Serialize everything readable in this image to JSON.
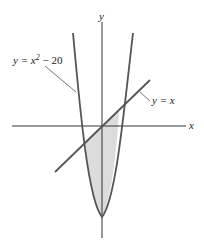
{
  "figure": {
    "axes": {
      "x_label": "x",
      "y_label": "y"
    },
    "curves": [
      {
        "id": "parabola",
        "equation_lhs": "y = x",
        "exponent": "2",
        "equation_rhs": " − 20"
      },
      {
        "id": "line",
        "equation": "y = x"
      }
    ],
    "shaded_region": "region between y = x² − 20 and y = x",
    "colors": {
      "curve": "#555555",
      "axis": "#333333",
      "fill": "#d9d9d9",
      "text": "#222222"
    }
  }
}
